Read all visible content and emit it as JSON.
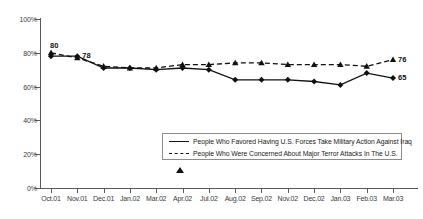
{
  "chart_data": {
    "type": "line",
    "title": "",
    "xlabel": "",
    "ylabel": "",
    "ylim": [
      0,
      100
    ],
    "ytick_labels": [
      "0%",
      "20%",
      "40%",
      "60%",
      "80%",
      "100%"
    ],
    "ytick_values": [
      0,
      20,
      40,
      60,
      80,
      100
    ],
    "grid": false,
    "legend_position": "inside-bottom-center",
    "categories": [
      "Oct.01",
      "Nov.01",
      "Dec.01",
      "Jan.02",
      "Mar.02",
      "Apr.02",
      "Jul.02",
      "Aug.02",
      "Sep.02",
      "Nov.02",
      "Dec.02",
      "Jan.03",
      "Feb.03",
      "Mar.03"
    ],
    "series": [
      {
        "name": "People Who Favored Having U.S. Forces Take Military Action Against Iraq",
        "style": "solid",
        "marker": "diamond",
        "values": [
          78,
          78,
          71,
          71,
          70,
          71,
          70,
          64,
          64,
          64,
          63,
          61,
          68,
          65
        ]
      },
      {
        "name": "People Who Were Concerned About Major Terror Attacks In The U.S.",
        "style": "dashed",
        "marker": "triangle",
        "values": [
          80,
          77,
          72,
          71,
          71,
          73,
          73,
          74,
          74,
          73,
          73,
          73,
          72,
          76
        ]
      }
    ],
    "annotations": [
      {
        "text": "80",
        "series": 1,
        "index": 0,
        "position": "above-left"
      },
      {
        "text": "78",
        "series": 0,
        "index": 1,
        "position": "right"
      },
      {
        "text": "76",
        "series": 1,
        "index": 13,
        "position": "right"
      },
      {
        "text": "65",
        "series": 0,
        "index": 13,
        "position": "right"
      }
    ],
    "legend": [
      "People Who Favored Having U.S. Forces Take Military Action Against Iraq",
      "People Who Were Concerned About Major Terror Attacks In The U.S."
    ],
    "colors": {
      "series": "#111111",
      "axis": "#5a5a5a",
      "text": "#333333"
    }
  }
}
